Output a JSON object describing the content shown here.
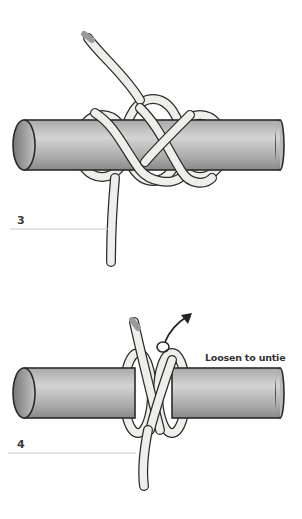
{
  "diagram": {
    "steps": [
      {
        "number": "3",
        "description": ""
      },
      {
        "number": "4",
        "annotation": "Loosen to untie"
      }
    ],
    "colors": {
      "pole_fill": "#b5b5b5",
      "pole_end": "#8f8f8f",
      "rope_fill": "#eeeeea",
      "outline": "#2b2b2b",
      "leader_line": "#c8c8c8",
      "arrow": "#222222"
    }
  }
}
